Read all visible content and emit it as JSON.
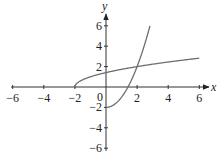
{
  "chart_data": {
    "type": "line",
    "title": "",
    "xlabel": "x",
    "ylabel": "y",
    "xlim": [
      -6,
      6
    ],
    "ylim": [
      -6,
      6
    ],
    "grid": false,
    "legend": null,
    "x_ticks": [
      -6,
      -4,
      -2,
      0,
      2,
      4,
      6
    ],
    "x_tick_labels": [
      "−6",
      "−4",
      "−2",
      "0",
      "2",
      "4",
      "6"
    ],
    "y_ticks": [
      -6,
      -4,
      -2,
      2,
      4,
      6
    ],
    "y_tick_labels": [
      "−6",
      "−4",
      "−2",
      "2",
      "4",
      "6"
    ],
    "origin_label": "0",
    "series": [
      {
        "name": "y = √(x+2)",
        "color": "#6e6e6e",
        "x": [
          -2,
          -1.9,
          -1.75,
          -1.5,
          -1,
          0,
          1,
          2,
          3,
          4,
          5,
          6
        ],
        "y": [
          0,
          0.32,
          0.5,
          0.71,
          1,
          1.41,
          1.73,
          2,
          2.24,
          2.45,
          2.65,
          2.83
        ]
      },
      {
        "name": "y = x² − 2 (x ≥ 0)",
        "color": "#6e6e6e",
        "x": [
          0,
          0.5,
          1,
          1.414,
          1.75,
          2,
          2.25,
          2.5,
          2.83
        ],
        "y": [
          -2,
          -1.75,
          -1,
          0,
          1.06,
          2,
          3.06,
          4.25,
          6
        ]
      }
    ],
    "annotations": []
  },
  "labels": {
    "x_axis": "x",
    "y_axis": "y",
    "origin": "0"
  }
}
